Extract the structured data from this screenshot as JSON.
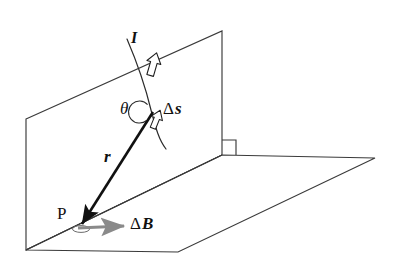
{
  "figure": {
    "type": "physics-vector-diagram",
    "background_color": "#ffffff",
    "line_color": "#2b2b2b",
    "vector_color": "#111111",
    "field_arrow_color": "#808080"
  },
  "labels": {
    "current": "I",
    "angle": "θ",
    "element_delta": "Δ",
    "element_symbol": "s",
    "radius_vector": "r",
    "point": "P",
    "field_delta": "Δ",
    "field_symbol": "B"
  },
  "elements": {
    "vertical_plane": {
      "name": "vertical-plane",
      "points": "26,119 222,31 222,155 26,250"
    },
    "horizontal_plane": {
      "name": "horizontal-plane",
      "points": "26,250 178,252 375,158 222,155"
    },
    "right_angle_marker": {
      "name": "right-angle-marker",
      "points": "222,140 237,140 237,155"
    },
    "wire": {
      "name": "current-carrying-wire",
      "path": "M 128,41 C 137,62 146,86 152,112 C 157,131 160,141 166,150"
    },
    "radius_vector": {
      "name": "r-vector",
      "from": "154,113",
      "to": "82,225"
    },
    "field_vector": {
      "name": "delta-B-vector",
      "from": "80,228",
      "to": "126,226"
    },
    "angle_arc": {
      "name": "theta-arc",
      "center": "153,113",
      "radius": 11
    }
  }
}
